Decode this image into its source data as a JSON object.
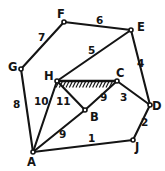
{
  "figure": {
    "title_fragment": "",
    "width": 165,
    "height": 171,
    "background": "#ffffff",
    "ink_color": "#141414"
  },
  "diagram": {
    "type": "truss-linkage-graph",
    "vertices": [
      {
        "id": "A",
        "label": "A",
        "x": 33,
        "y": 152,
        "label_x": 27,
        "label_y": 157,
        "marker": true
      },
      {
        "id": "B",
        "label": "B",
        "x": 85,
        "y": 110,
        "label_x": 90,
        "label_y": 112,
        "marker": true
      },
      {
        "id": "C",
        "label": "C",
        "x": 117,
        "y": 81,
        "label_x": 116,
        "label_y": 68,
        "marker": true
      },
      {
        "id": "D",
        "label": "D",
        "x": 150,
        "y": 105,
        "label_x": 152,
        "label_y": 101,
        "marker": true
      },
      {
        "id": "E",
        "label": "E",
        "x": 131,
        "y": 30,
        "label_x": 137,
        "label_y": 22,
        "marker": true
      },
      {
        "id": "F",
        "label": "F",
        "x": 64,
        "y": 22,
        "label_x": 57,
        "label_y": 9,
        "marker": true
      },
      {
        "id": "G",
        "label": "G",
        "x": 21,
        "y": 69,
        "label_x": 8,
        "label_y": 62,
        "marker": true
      },
      {
        "id": "H",
        "label": "H",
        "x": 57,
        "y": 81,
        "label_x": 44,
        "label_y": 71,
        "marker": true
      },
      {
        "id": "J",
        "label": "J",
        "x": 133,
        "y": 140,
        "label_x": 135,
        "label_y": 142,
        "marker": true
      }
    ],
    "edges": [
      {
        "id": "AJ",
        "from": "A",
        "to": "J",
        "label": "1",
        "label_x": 88,
        "label_y": 133
      },
      {
        "id": "JD",
        "from": "J",
        "to": "D",
        "label": "2",
        "label_x": 141,
        "label_y": 117
      },
      {
        "id": "CD",
        "from": "C",
        "to": "D",
        "label": "3",
        "label_x": 120,
        "label_y": 92
      },
      {
        "id": "DE",
        "from": "D",
        "to": "E",
        "label": "4",
        "label_x": 137,
        "label_y": 58
      },
      {
        "id": "HE",
        "from": "H",
        "to": "E",
        "label": "5",
        "label_x": 88,
        "label_y": 45
      },
      {
        "id": "FE",
        "from": "F",
        "to": "E",
        "label": "6",
        "label_x": 96,
        "label_y": 15
      },
      {
        "id": "GF",
        "from": "G",
        "to": "F",
        "label": "7",
        "label_x": 38,
        "label_y": 32
      },
      {
        "id": "GA",
        "from": "G",
        "to": "A",
        "label": "8",
        "label_x": 13,
        "label_y": 99
      },
      {
        "id": "AB",
        "from": "A",
        "to": "B",
        "label": "9",
        "label_x": 59,
        "label_y": 129
      },
      {
        "id": "BC",
        "from": "B",
        "to": "C",
        "label": "9",
        "label_x": 100,
        "label_y": 92
      },
      {
        "id": "AH",
        "from": "A",
        "to": "H",
        "label": "10",
        "label_x": 34,
        "label_y": 96
      },
      {
        "id": "HB",
        "from": "H",
        "to": "B",
        "label": "11",
        "label_x": 56,
        "label_y": 96
      }
    ],
    "support": {
      "name": "ground-hatch-HC",
      "from": "H",
      "to": "C",
      "hatch_count": 17,
      "hatch_length": 6,
      "hatch_slant": 3
    }
  }
}
